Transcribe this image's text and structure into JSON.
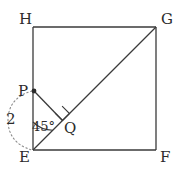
{
  "figure": {
    "kind": "geometry-diagram",
    "stroke_color": "#3a3a3a",
    "text_color": "#2b2b2b",
    "background_color": "#ffffff"
  },
  "vertices": {
    "H": {
      "label": "H",
      "x": 33,
      "y": 27
    },
    "G": {
      "label": "G",
      "x": 156,
      "y": 27
    },
    "F": {
      "label": "F",
      "x": 156,
      "y": 150
    },
    "E": {
      "label": "E",
      "x": 33,
      "y": 150
    }
  },
  "points": {
    "P": {
      "label": "P",
      "x": 34,
      "y": 91,
      "marker": "filled-dot"
    },
    "Q": {
      "label": "Q",
      "x": 62,
      "y": 121,
      "marker": "none"
    }
  },
  "segments": [
    {
      "name": "side-HG",
      "from": "H",
      "to": "G"
    },
    {
      "name": "side-GF",
      "from": "G",
      "to": "F"
    },
    {
      "name": "side-FE",
      "from": "F",
      "to": "E"
    },
    {
      "name": "side-EH",
      "from": "E",
      "to": "H"
    },
    {
      "name": "diagonal-EG",
      "from": "E",
      "to": "G"
    },
    {
      "name": "segment-PQ",
      "from": "P",
      "to": "Q"
    }
  ],
  "annotations": {
    "length_2": {
      "label": "2",
      "measures": "PE",
      "style": "dotted-brace-arc"
    },
    "angle_45": {
      "label": "45°",
      "at": "E",
      "between": [
        "EH",
        "EG"
      ]
    },
    "right_angle": {
      "label": "",
      "at": "Q",
      "between": [
        "QP",
        "QG"
      ],
      "style": "square-mark"
    }
  }
}
